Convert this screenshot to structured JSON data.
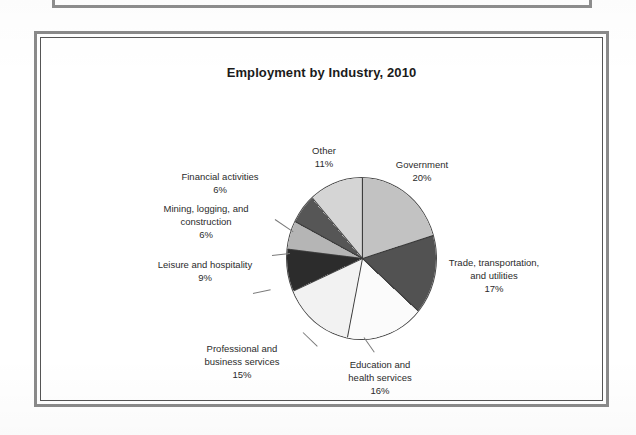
{
  "figure": {
    "title": "Employment by Industry, 2010"
  },
  "chart_data": {
    "type": "pie",
    "title": "Employment by Industry, 2010",
    "xlabel": "",
    "ylabel": "",
    "legend_position": "none",
    "grid": false,
    "unit": "%",
    "start_angle_deg": 0,
    "direction": "clockwise",
    "categories": [
      "Government",
      "Trade, transportation, and utilities",
      "Education and health services",
      "Professional and business services",
      "Leisure and hospitality",
      "Mining, logging, and construction",
      "Financial activities",
      "Other"
    ],
    "values": [
      20,
      17,
      16,
      15,
      9,
      6,
      6,
      11
    ],
    "slices": [
      {
        "name": "Government",
        "label": "Government",
        "value": 20,
        "value_label": "20%",
        "color": "#c2c2c2"
      },
      {
        "name": "Trade, transportation, and utilities",
        "label_line1": "Trade, transportation,",
        "label_line2": "and utilities",
        "value": 17,
        "value_label": "17%",
        "color": "#525252"
      },
      {
        "name": "Education and health services",
        "label_line1": "Education and",
        "label_line2": "health services",
        "value": 16,
        "value_label": "16%",
        "color": "#fbfbfb"
      },
      {
        "name": "Professional and business services",
        "label_line1": "Professional and",
        "label_line2": "business services",
        "value": 15,
        "value_label": "15%",
        "color": "#f2f2f2"
      },
      {
        "name": "Leisure and hospitality",
        "label": "Leisure and hospitality",
        "value": 9,
        "value_label": "9%",
        "color": "#2c2c2c"
      },
      {
        "name": "Mining, logging, and construction",
        "label_line1": "Mining, logging, and",
        "label_line2": "construction",
        "value": 6,
        "value_label": "6%",
        "color": "#b5b5b5"
      },
      {
        "name": "Financial activities",
        "label": "Financial activities",
        "value": 6,
        "value_label": "6%",
        "color": "#565656"
      },
      {
        "name": "Other",
        "label": "Other",
        "value": 11,
        "value_label": "11%",
        "color": "#d5d5d5"
      }
    ]
  }
}
